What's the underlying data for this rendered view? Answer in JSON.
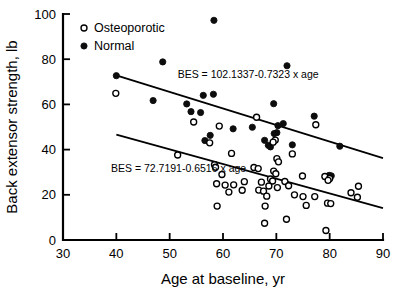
{
  "chart_data": {
    "type": "scatter",
    "title": "",
    "xlabel": "Age at baseline, yr",
    "ylabel": "Back extensor strength, lb",
    "xlim": [
      30,
      90
    ],
    "ylim": [
      0,
      100
    ],
    "xticks": [
      30,
      40,
      50,
      60,
      70,
      80,
      90
    ],
    "yticks": [
      0,
      20,
      40,
      60,
      80,
      100
    ],
    "grid": false,
    "legend_position": "top-left",
    "legend": [
      {
        "key": "osteoporotic",
        "label": "Osteoporotic",
        "marker": "open-circle"
      },
      {
        "key": "normal",
        "label": "Normal",
        "marker": "filled-circle"
      }
    ],
    "annotations": [
      {
        "key": "normal-fit-equation",
        "text": "BES = 102.1337-0.7323 x age",
        "x": 51.5,
        "y": 71.5
      },
      {
        "key": "osteoporotic-fit-equation",
        "text": "BES = 72.7191-0.6516 x age",
        "x": 39.0,
        "y": 30.0
      }
    ],
    "fit_lines": [
      {
        "key": "normal-fit-line",
        "series": "normal",
        "intercept": 102.1337,
        "slope": -0.7323,
        "x_start": 40,
        "x_end": 90
      },
      {
        "key": "osteoporotic-fit-line",
        "series": "osteoporotic",
        "intercept": 72.7191,
        "slope": -0.6516,
        "x_start": 40,
        "x_end": 90
      }
    ],
    "series": [
      {
        "name": "Normal",
        "key": "normal",
        "marker": "filled-circle",
        "points": [
          [
            58.3,
            97.2
          ],
          [
            48.7,
            78.8
          ],
          [
            72.0,
            77.1
          ],
          [
            40.0,
            72.7
          ],
          [
            58.2,
            64.5
          ],
          [
            56.3,
            64.0
          ],
          [
            46.9,
            61.7
          ],
          [
            69.5,
            60.3
          ],
          [
            53.2,
            60.2
          ],
          [
            54.0,
            56.8
          ],
          [
            55.8,
            56.4
          ],
          [
            77.1,
            54.8
          ],
          [
            71.3,
            51.5
          ],
          [
            70.3,
            50.6
          ],
          [
            65.5,
            49.9
          ],
          [
            61.9,
            49.2
          ],
          [
            70.1,
            47.5
          ],
          [
            69.6,
            47.1
          ],
          [
            57.6,
            46.3
          ],
          [
            67.8,
            44.1
          ],
          [
            56.6,
            44.0
          ],
          [
            68.5,
            41.9
          ],
          [
            73.0,
            42.1
          ],
          [
            81.9,
            41.5
          ],
          [
            68.9,
            41.2
          ],
          [
            79.9,
            28.6
          ],
          [
            80.3,
            28.4
          ]
        ]
      },
      {
        "name": "Osteoporotic",
        "key": "osteoporotic",
        "marker": "open-circle",
        "points": [
          [
            39.9,
            64.9
          ],
          [
            66.3,
            54.3
          ],
          [
            77.4,
            51.0
          ],
          [
            59.3,
            50.4
          ],
          [
            54.5,
            52.2
          ],
          [
            69.8,
            44.2
          ],
          [
            69.4,
            43.3
          ],
          [
            57.5,
            43.0
          ],
          [
            51.5,
            37.6
          ],
          [
            61.6,
            38.3
          ],
          [
            73.0,
            38.1
          ],
          [
            70.1,
            36.0
          ],
          [
            70.4,
            34.6
          ],
          [
            58.4,
            33.3
          ],
          [
            58.6,
            32.2
          ],
          [
            65.8,
            32.1
          ],
          [
            66.6,
            31.6
          ],
          [
            69.5,
            30.5
          ],
          [
            69.9,
            29.3
          ],
          [
            59.8,
            29.0
          ],
          [
            74.9,
            28.3
          ],
          [
            79.1,
            28.1
          ],
          [
            80.0,
            27.2
          ],
          [
            79.7,
            26.4
          ],
          [
            68.9,
            27.0
          ],
          [
            69.3,
            26.1
          ],
          [
            71.6,
            25.9
          ],
          [
            67.2,
            25.6
          ],
          [
            64.0,
            25.8
          ],
          [
            62.0,
            24.4
          ],
          [
            60.4,
            24.3
          ],
          [
            58.8,
            24.9
          ],
          [
            72.3,
            24.0
          ],
          [
            68.6,
            23.9
          ],
          [
            70.2,
            23.2
          ],
          [
            66.7,
            22.1
          ],
          [
            63.6,
            22.0
          ],
          [
            67.6,
            21.6
          ],
          [
            61.1,
            21.2
          ],
          [
            84.0,
            20.9
          ],
          [
            85.4,
            23.8
          ],
          [
            73.4,
            20.0
          ],
          [
            75.0,
            19.2
          ],
          [
            77.2,
            19.2
          ],
          [
            85.2,
            18.9
          ],
          [
            68.2,
            19.4
          ],
          [
            79.6,
            16.3
          ],
          [
            80.2,
            16.1
          ],
          [
            75.6,
            15.3
          ],
          [
            58.9,
            15.0
          ],
          [
            67.9,
            15.0
          ],
          [
            71.9,
            9.2
          ],
          [
            67.8,
            7.4
          ],
          [
            79.3,
            4.2
          ]
        ]
      }
    ]
  }
}
